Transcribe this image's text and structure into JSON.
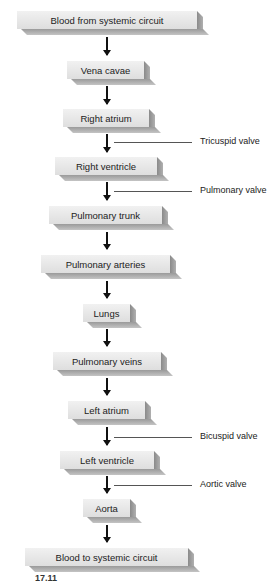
{
  "diagram": {
    "nodes": [
      {
        "label": "Blood from systemic circuit"
      },
      {
        "label": "Vena cavae"
      },
      {
        "label": "Right atrium"
      },
      {
        "label": "Right ventricle"
      },
      {
        "label": "Pulmonary trunk"
      },
      {
        "label": "Pulmonary arteries"
      },
      {
        "label": "Lungs"
      },
      {
        "label": "Pulmonary veins"
      },
      {
        "label": "Left atrium"
      },
      {
        "label": "Left ventricle"
      },
      {
        "label": "Aorta"
      },
      {
        "label": "Blood to systemic circuit"
      }
    ],
    "valves": [
      {
        "label": "Tricuspid valve"
      },
      {
        "label": "Pulmonary valve"
      },
      {
        "label": "Bicuspid valve"
      },
      {
        "label": "Aortic valve"
      }
    ],
    "figure_fragment": "17.11"
  }
}
